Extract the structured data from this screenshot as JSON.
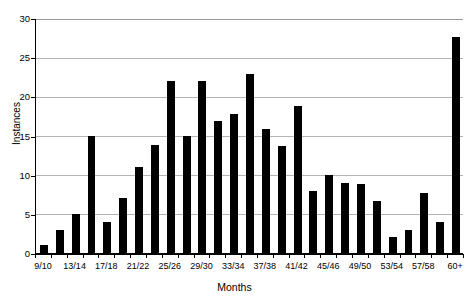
{
  "chart_data": {
    "type": "bar",
    "title": "",
    "xlabel": "Months",
    "ylabel": "Instances",
    "ylim": [
      0,
      30
    ],
    "ytick_values": [
      0,
      5,
      10,
      15,
      20,
      25,
      30
    ],
    "ytick_labels": [
      "0",
      "5",
      "10",
      "15",
      "20",
      "25",
      "30"
    ],
    "grid": "horizontal",
    "legend": "none",
    "bar_color": "#000000",
    "categories": [
      "9/10",
      "11/12",
      "13/14",
      "15/16",
      "17/18",
      "19/20",
      "21/22",
      "23/24",
      "25/26",
      "27/28",
      "29/30",
      "31/32",
      "33/34",
      "35/36",
      "37/38",
      "39/40",
      "41/42",
      "43/44",
      "45/46",
      "47/48",
      "49/50",
      "51/52",
      "53/54",
      "55/56",
      "57/58",
      "59/60",
      "60+"
    ],
    "values": [
      1,
      3,
      5,
      15,
      4,
      7,
      11,
      13.8,
      21.9,
      14.9,
      21.9,
      16.9,
      17.8,
      22.8,
      15.8,
      13.7,
      18.8,
      7.9,
      9.9,
      9.0,
      8.8,
      6.7,
      2.0,
      2.9,
      7.6,
      3.9,
      27.6
    ],
    "xtick_labels_shown": [
      "9/10",
      "13/14",
      "17/18",
      "21/22",
      "25/26",
      "29/30",
      "33/34",
      "37/38",
      "41/42",
      "45/46",
      "49/50",
      "53/54",
      "57/58",
      "60+"
    ],
    "xtick_label_indices": [
      0,
      2,
      4,
      6,
      8,
      10,
      12,
      14,
      16,
      18,
      20,
      22,
      24,
      26
    ]
  },
  "figure": {
    "top_clipped_caption": "",
    "background": "#ffffff"
  }
}
